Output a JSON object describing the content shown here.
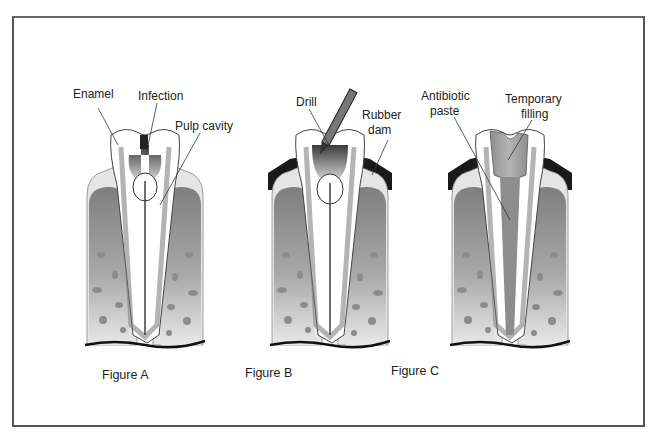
{
  "diagram": {
    "colors": {
      "border": "#555555",
      "bone_dark": "#8a8a8a",
      "bone_light": "#e6e6e6",
      "gum": "#d9d9d9",
      "dam": "#1a1a1a",
      "tooth": "#ffffff",
      "pulp": "#7a7a7a",
      "filling": "#9a9a9a"
    },
    "figures": [
      {
        "id": "A",
        "caption": "Figure A",
        "labels": [
          {
            "text": "Enamel"
          },
          {
            "text": "Infection"
          },
          {
            "text": "Pulp cavity"
          }
        ]
      },
      {
        "id": "B",
        "caption": "Figure B",
        "labels": [
          {
            "text": "Drill"
          },
          {
            "text": "Rubber",
            "text2": "dam"
          }
        ]
      },
      {
        "id": "C",
        "caption": "Figure C",
        "labels": [
          {
            "text": "Antibiotic",
            "text2": "paste"
          },
          {
            "text": "Temporary",
            "text2": "filling"
          }
        ]
      }
    ]
  }
}
